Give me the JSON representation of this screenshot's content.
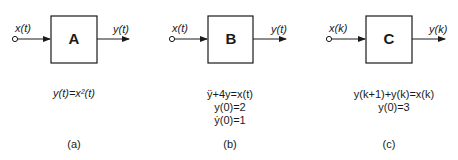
{
  "blocks": [
    {
      "id": "a",
      "name": "A",
      "input": "x(t)",
      "output": "y(t)",
      "equations": [
        "y(t)=x²(t)"
      ],
      "caption": "(a)"
    },
    {
      "id": "b",
      "name": "B",
      "input": "x(t)",
      "output": "y(t)",
      "equations": [
        "ÿ+4y=x(t)",
        "y(0)=2",
        "ẏ(0)=1"
      ],
      "caption": "(b)"
    },
    {
      "id": "c",
      "name": "C",
      "input": "x(k)",
      "output": "y(k)",
      "equations": [
        "y(k+1)+y(k)=x(k)",
        "y(0)=3"
      ],
      "caption": "(c)"
    }
  ],
  "colors": {
    "stroke": "#1a1a1a",
    "background": "#ffffff"
  }
}
